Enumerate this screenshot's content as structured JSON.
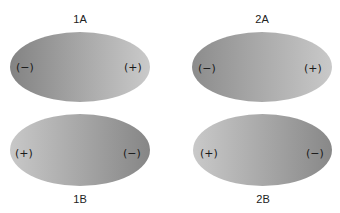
{
  "diagram": {
    "type": "charge-gradient ellipses",
    "panels": [
      {
        "id": "1A",
        "label": "1A",
        "left_charge": "(−)",
        "right_charge": "(+)",
        "gradient": {
          "left_color": "#838383",
          "right_color": "#cacaca"
        },
        "ellipse": {
          "x": 10,
          "y": 32,
          "w": 140,
          "h": 70
        },
        "label_pos": {
          "x": 60,
          "y": 13
        }
      },
      {
        "id": "2A",
        "label": "2A",
        "left_charge": "(−)",
        "right_charge": "(+)",
        "gradient": {
          "left_color": "#8c8c8c",
          "right_color": "#c9c9c9"
        },
        "ellipse": {
          "x": 192,
          "y": 32,
          "w": 140,
          "h": 70
        },
        "label_pos": {
          "x": 242,
          "y": 13
        }
      },
      {
        "id": "1B",
        "label": "1B",
        "left_charge": "(+)",
        "right_charge": "(−)",
        "gradient": {
          "left_color": "#c8c8c8",
          "right_color": "#868686"
        },
        "ellipse": {
          "x": 10,
          "y": 114,
          "w": 140,
          "h": 72
        },
        "label_pos": {
          "x": 60,
          "y": 193
        }
      },
      {
        "id": "2B",
        "label": "2B",
        "left_charge": "(+)",
        "right_charge": "(−)",
        "gradient": {
          "left_color": "#c9c9c9",
          "right_color": "#888888"
        },
        "ellipse": {
          "x": 193,
          "y": 114,
          "w": 139,
          "h": 72
        },
        "label_pos": {
          "x": 243,
          "y": 193
        }
      }
    ]
  }
}
